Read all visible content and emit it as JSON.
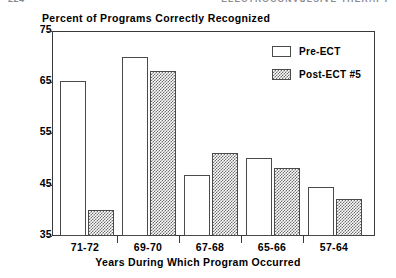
{
  "page_header": {
    "folio": "224",
    "running_title": "ELECTROCONVULSIVE THERAPY"
  },
  "chart_data": {
    "type": "bar",
    "title": "Percent of Programs Correctly Recognized",
    "xlabel": "Years During Which Program Occurred",
    "ylabel": "",
    "categories": [
      "71-72",
      "69-70",
      "67-68",
      "65-66",
      "57-64"
    ],
    "series": [
      {
        "name": "Pre-ECT",
        "values": [
          65.3,
          70.0,
          47.0,
          50.3,
          44.5
        ]
      },
      {
        "name": "Post-ECT #5",
        "values": [
          40.0,
          67.2,
          51.2,
          48.3,
          42.3
        ]
      }
    ],
    "ylim": [
      35,
      75
    ],
    "yticks": [
      75,
      65,
      55,
      45,
      35
    ],
    "ytick_labels": [
      "75",
      "65",
      "55",
      "45",
      "35"
    ],
    "grid": false,
    "legend_position": "top-right",
    "colors": {
      "pre_fill": "#ffffff",
      "post_fill": "#6d6d6d",
      "axis": "#3a3a3a",
      "bar_outline": "#4a4a4a",
      "text": "#000000"
    }
  }
}
